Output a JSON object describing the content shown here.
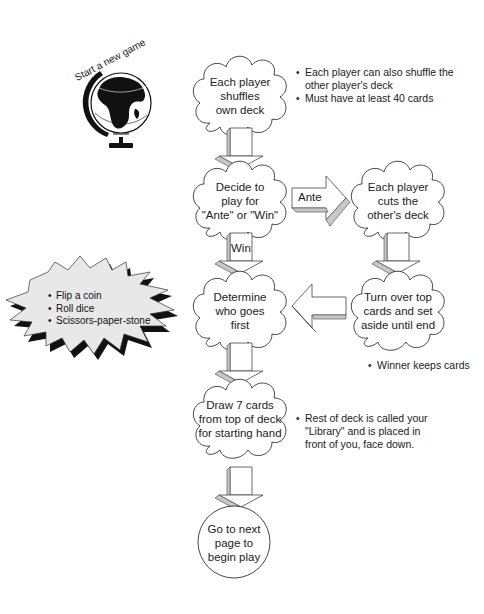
{
  "start": {
    "label": "Start a new game",
    "icon": "globe-icon"
  },
  "nodes": {
    "shuffle": {
      "lines": [
        "Each player",
        "shuffles",
        "own deck"
      ],
      "shape": "cloud"
    },
    "decide": {
      "lines": [
        "Decide to",
        "play for",
        "\"Ante\" or \"Win\""
      ],
      "shape": "cloud"
    },
    "cut": {
      "lines": [
        "Each player",
        "cuts the",
        "other's deck"
      ],
      "shape": "cloud"
    },
    "determine": {
      "lines": [
        "Determine",
        "who goes",
        "first"
      ],
      "shape": "cloud"
    },
    "turnover": {
      "lines": [
        "Turn over top",
        "cards and set",
        "aside until end"
      ],
      "shape": "cloud"
    },
    "draw": {
      "lines": [
        "Draw 7 cards",
        "from top of deck",
        "for starting hand"
      ],
      "shape": "cloud"
    },
    "next": {
      "lines": [
        "Go to next",
        "page to",
        "begin play"
      ],
      "shape": "circle"
    }
  },
  "arrows": {
    "ante_label": "Ante",
    "win_label": "Win"
  },
  "notes": {
    "shuffle": [
      "Each player can also shuffle the",
      "other player's deck",
      "Must have at least 40 cards"
    ],
    "turnover": [
      "Winner keeps cards"
    ],
    "draw": [
      "Rest of deck is called your",
      "\"Library\" and is placed in",
      "front of you, face down."
    ]
  },
  "burst": {
    "items": [
      "Flip a coin",
      "Roll dice",
      "Scissors-paper-stone"
    ]
  },
  "colors": {
    "line": "#333333",
    "arrow_face": "#ffffff",
    "arrow_shade": "#c8c8c8",
    "burst_shadow": "#111111",
    "burst_fill": "#e8e8e8"
  }
}
